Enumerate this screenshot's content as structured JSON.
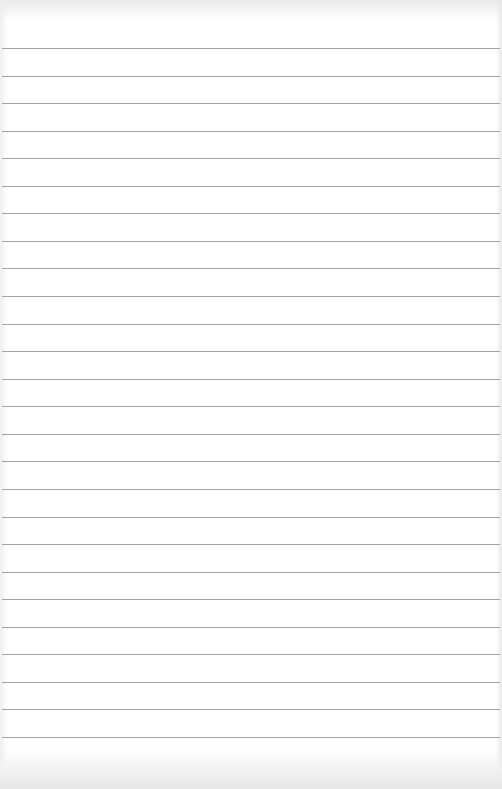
{
  "document": {
    "type": "lined-paper",
    "text": "",
    "colors": {
      "paper": "#ffffff",
      "rule": "#a3a3a3",
      "edge_shadow": "#e8e8e8"
    },
    "rules": {
      "count": 26,
      "first_y": 48,
      "spacing": 27.56,
      "thickness": 1
    }
  }
}
